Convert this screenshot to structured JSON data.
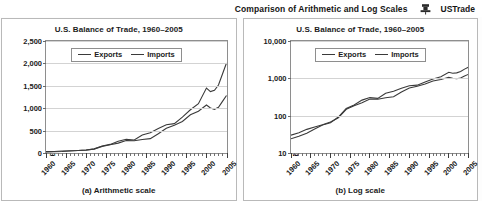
{
  "header": {
    "title": "Comparison of Arithmetic and Log Scales",
    "icon": "pushpin-icon",
    "label": "USTrade"
  },
  "colors": {
    "line": "#3a3a3a",
    "grid": "#d3d3d3",
    "axis": "#8e8e8e",
    "panel_border": "#b9b9b9",
    "background": "#ffffff",
    "text": "#1b1b1b"
  },
  "panels": [
    {
      "caption": "(a) Arithmetic scale",
      "chart_data": {
        "type": "line",
        "scale": "linear",
        "title": "U.S. Balance of Trade, 1960–2005",
        "xlabel": "",
        "ylabel": "Billions of Current Dollars",
        "grid": true,
        "legend_position": "top-left-inside",
        "xlim": [
          1960,
          2005
        ],
        "ylim": [
          0,
          2500
        ],
        "yticks": [
          0,
          500,
          1000,
          1500,
          2000,
          2500
        ],
        "yticklabels": [
          "0",
          "500",
          "1,000",
          "1,500",
          "2,000",
          "2,500"
        ],
        "xticks": [
          1960,
          1965,
          1970,
          1975,
          1980,
          1985,
          1990,
          1995,
          2000,
          2005
        ],
        "xticklabels": [
          "1960",
          "1965",
          "1970",
          "1975",
          "1980",
          "1985",
          "1990",
          "1995",
          "2000",
          "2005"
        ],
        "x": [
          1960,
          1962,
          1964,
          1966,
          1968,
          1970,
          1972,
          1974,
          1976,
          1978,
          1980,
          1982,
          1984,
          1986,
          1988,
          1990,
          1992,
          1994,
          1996,
          1998,
          2000,
          2001,
          2002,
          2003,
          2004,
          2005
        ],
        "series": [
          {
            "name": "Exports",
            "values": [
              30,
              35,
              43,
              50,
              57,
              68,
              87,
              148,
              185,
              221,
              280,
              275,
              302,
              320,
              430,
              552,
              617,
              703,
              852,
              933,
              1071,
              1005,
              975,
              1020,
              1151,
              1283
            ]
          },
          {
            "name": "Imports",
            "values": [
              24,
              28,
              34,
              44,
              56,
              65,
              92,
              155,
              192,
              261,
              305,
              290,
              400,
              450,
              545,
              630,
              656,
              801,
              965,
              1100,
              1450,
              1370,
              1399,
              1517,
              1764,
              2010
            ]
          }
        ]
      }
    },
    {
      "caption": "(b) Log scale",
      "chart_data": {
        "type": "line",
        "scale": "log",
        "title": "U.S. Balance of Trade, 1960–2005",
        "xlabel": "",
        "ylabel": "Billions of Current Dollars",
        "grid": true,
        "legend_position": "top-left-inside",
        "xlim": [
          1960,
          2005
        ],
        "ylim": [
          10,
          10000
        ],
        "yticks": [
          10,
          100,
          1000,
          10000
        ],
        "yticklabels": [
          "10",
          "100",
          "1,000",
          "10,000"
        ],
        "xticks": [
          1960,
          1965,
          1970,
          1975,
          1980,
          1985,
          1990,
          1995,
          2000,
          2005
        ],
        "xticklabels": [
          "1960",
          "1965",
          "1970",
          "1975",
          "1980",
          "1985",
          "1990",
          "1995",
          "2000",
          "2005"
        ],
        "x": [
          1960,
          1962,
          1964,
          1966,
          1968,
          1970,
          1972,
          1974,
          1976,
          1978,
          1980,
          1982,
          1984,
          1986,
          1988,
          1990,
          1992,
          1994,
          1996,
          1998,
          2000,
          2001,
          2002,
          2003,
          2004,
          2005
        ],
        "series": [
          {
            "name": "Exports",
            "values": [
              30,
              35,
              43,
              50,
              57,
              68,
              87,
              148,
              185,
              221,
              280,
              275,
              302,
              320,
              430,
              552,
              617,
              703,
              852,
              933,
              1071,
              1005,
              975,
              1020,
              1151,
              1283
            ]
          },
          {
            "name": "Imports",
            "values": [
              24,
              28,
              34,
              44,
              56,
              65,
              92,
              155,
              192,
              261,
              305,
              290,
              400,
              450,
              545,
              630,
              656,
              801,
              965,
              1100,
              1450,
              1370,
              1399,
              1517,
              1764,
              2010
            ]
          }
        ]
      }
    }
  ]
}
